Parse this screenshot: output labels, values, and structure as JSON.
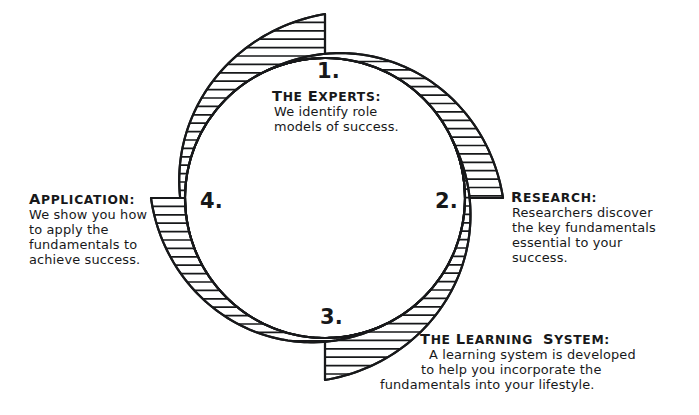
{
  "diagram": {
    "style": "hand-drawn circular flow diagram",
    "ink_color": "#17181a",
    "background_color": "#ffffff",
    "circle": {
      "center_x": 325,
      "center_y": 198,
      "radius": 140
    }
  },
  "steps": [
    {
      "number": "1.",
      "heading": "THE EXPERTS:",
      "heading_caps": [
        "T",
        "E"
      ],
      "body": [
        "We identify role",
        "models of success."
      ],
      "position": "top",
      "arrow_tail": "top"
    },
    {
      "number": "2.",
      "heading": "RESEARCH:",
      "heading_caps": [
        "R"
      ],
      "body": [
        "Researchers discover",
        "the key fundamentals",
        "essential to your",
        "success."
      ],
      "position": "right",
      "arrow_tail": "right"
    },
    {
      "number": "3.",
      "heading": "THE LEARNING SYSTEM:",
      "heading_caps": [
        "T",
        "L",
        "S"
      ],
      "body": [
        "A learning system is developed",
        "to help you incorporate the",
        "fundamentals into your lifestyle."
      ],
      "position": "bottom",
      "arrow_tail": "bottom"
    },
    {
      "number": "4.",
      "heading": "APPLICATION:",
      "heading_caps": [
        "A"
      ],
      "body": [
        "We show you how",
        "to apply the",
        "fundamentals to",
        "achieve success."
      ],
      "position": "left",
      "arrow_tail": "left"
    }
  ]
}
